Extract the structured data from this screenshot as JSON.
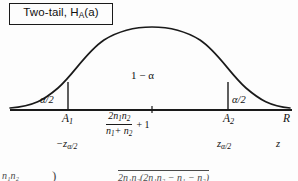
{
  "figure": {
    "title_box": {
      "text_main": "Two-tail, H",
      "text_sub": "A",
      "text_tail": "(a)"
    },
    "curve": {
      "type": "normal-distribution-bell-curve",
      "peak_x": 152,
      "peak_y": 28,
      "baseline_y": 110,
      "left_end_x": 10,
      "right_end_x": 290
    },
    "regions": {
      "left_tail_label": "α/2",
      "right_tail_label": "α/2",
      "center_label": "1 − α"
    },
    "boundaries": {
      "left_x": 68,
      "right_x": 228,
      "center_x": 152
    },
    "axis_labels": {
      "left_critical": "A",
      "left_critical_sub": "1",
      "right_critical": "A",
      "right_critical_sub": "2",
      "axis_name": "R"
    },
    "center_formula": {
      "numerator_main": "2n",
      "numerator_sub1": "1",
      "numerator_mid": "n",
      "numerator_sub2": "2",
      "denominator_main": "n",
      "denominator_sub1": "1",
      "denominator_plus": "+ n",
      "denominator_sub2": "2",
      "suffix": "+ 1"
    },
    "z_axis": {
      "negative_critical_sign": "−",
      "negative_critical_main": "z",
      "negative_critical_sub": "α/2",
      "positive_critical_main": "z",
      "positive_critical_sub": "α/2",
      "axis_name": "z"
    },
    "bottom_fragment": {
      "left": "n₁n₂",
      "paren": ")",
      "radical": "2n₁n₂(2n₁n₂ − n₁ − n₂)"
    },
    "colors": {
      "ink": "#1a1a1a",
      "paper": "#fdfdfd",
      "faded_ink": "#4a4a4a"
    }
  }
}
